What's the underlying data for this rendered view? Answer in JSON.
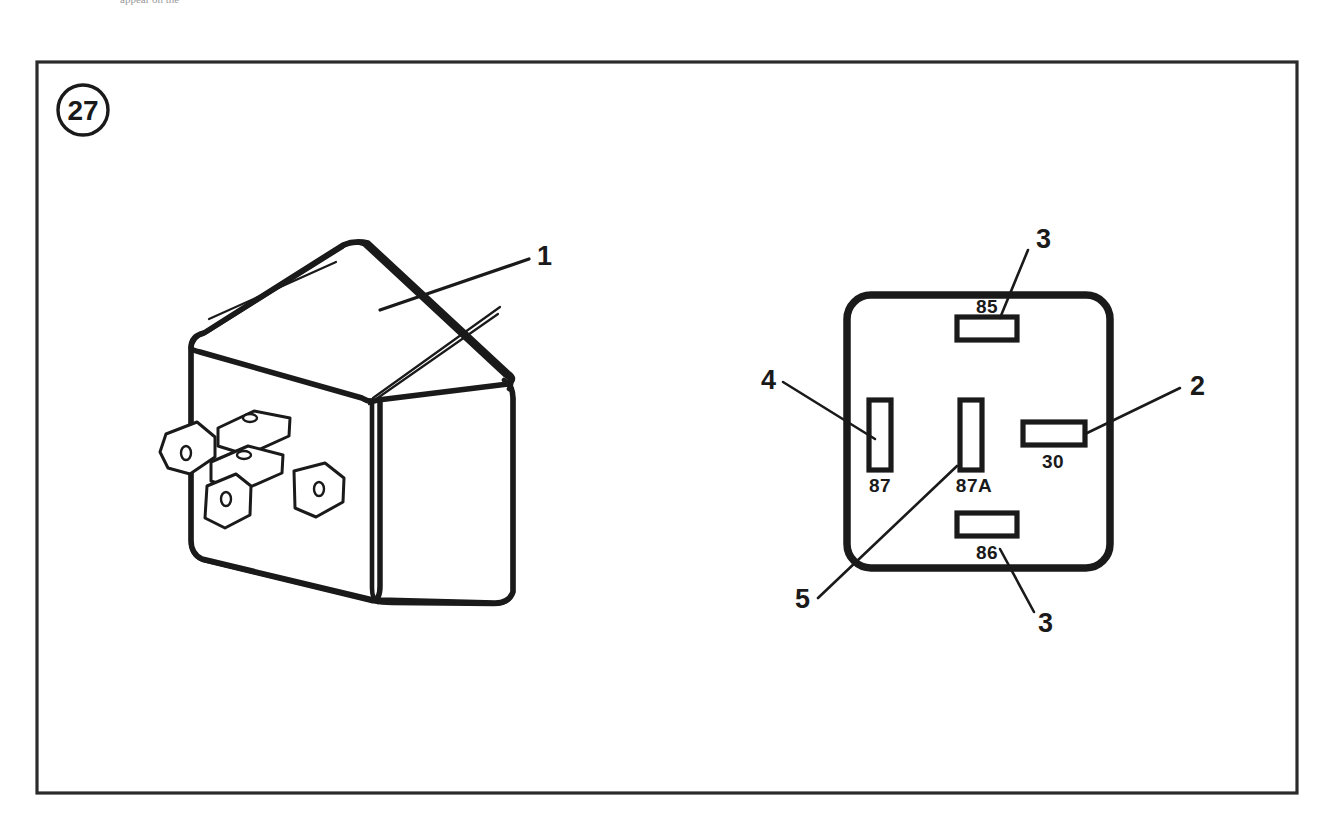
{
  "document": {
    "type": "technical-illustration",
    "subject": "automotive relay",
    "clipped_header_text": "appear on the"
  },
  "figure": {
    "marker_number": "27",
    "frame": {
      "x": 37,
      "y": 62,
      "width": 1260,
      "height": 731
    }
  },
  "callouts": [
    {
      "id": "1",
      "label": "1",
      "x": 537,
      "y": 256,
      "target": "relay-body"
    },
    {
      "id": "2",
      "label": "2",
      "x": 1190,
      "y": 387,
      "target": "terminal-30"
    },
    {
      "id": "3-top",
      "label": "3",
      "x": 1036,
      "y": 241,
      "target": "terminal-85"
    },
    {
      "id": "4",
      "label": "4",
      "x": 768,
      "y": 383,
      "target": "terminal-87"
    },
    {
      "id": "5",
      "label": "5",
      "x": 808,
      "y": 607,
      "target": "terminal-87a"
    },
    {
      "id": "3-bottom",
      "label": "3",
      "x": 1038,
      "y": 623,
      "target": "terminal-86"
    }
  ],
  "terminals": [
    {
      "id": "terminal-85",
      "label": "85",
      "position": "top",
      "slot": {
        "x": 957,
        "y": 317,
        "width": 60,
        "height": 23
      },
      "label_x": 987,
      "label_y": 313
    },
    {
      "id": "terminal-87",
      "label": "87",
      "position": "left",
      "slot": {
        "x": 869,
        "y": 400,
        "width": 22,
        "height": 70
      },
      "label_x": 880,
      "label_y": 492
    },
    {
      "id": "terminal-87a",
      "label": "87A",
      "position": "center",
      "slot": {
        "x": 960,
        "y": 400,
        "width": 22,
        "height": 70
      },
      "label_x": 972,
      "label_y": 492
    },
    {
      "id": "terminal-30",
      "label": "30",
      "position": "right",
      "slot": {
        "x": 1023,
        "y": 422,
        "width": 62,
        "height": 23
      },
      "label_x": 1053,
      "label_y": 468
    },
    {
      "id": "terminal-86",
      "label": "86",
      "position": "bottom",
      "slot": {
        "x": 957,
        "y": 513,
        "width": 60,
        "height": 23
      },
      "label_x": 987,
      "label_y": 559
    }
  ],
  "relay_base": {
    "id": "relay-base-view",
    "description": "bottom view of relay showing terminal slots",
    "outline": {
      "x": 847,
      "y": 295,
      "width": 263,
      "height": 273,
      "corner_radius": 24
    }
  },
  "relay_body": {
    "id": "relay-body-view",
    "description": "isometric view of relay housing with five spade terminals",
    "terminal_count": 5
  },
  "colors": {
    "ink": "#1a1a1a",
    "frame": "#2b2b2b",
    "paper": "#ffffff"
  }
}
